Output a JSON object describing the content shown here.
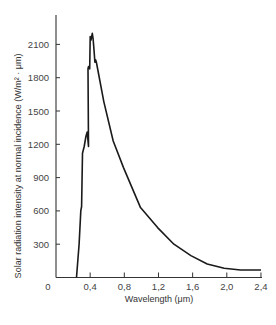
{
  "chart_data": {
    "type": "line",
    "title": "",
    "xlabel": "Wavelength (μm)",
    "ylabel": "Solar radiation intensity at normal incidence (W/m² · μm)",
    "xlim": [
      0,
      2.4
    ],
    "ylim": [
      0,
      2300
    ],
    "x_ticks": [
      0,
      0.4,
      0.8,
      1.2,
      1.6,
      2.0,
      2.4
    ],
    "x_tick_labels": [
      "0",
      "0,4",
      "0,8",
      "1,2",
      "1,6",
      "2,0",
      "2,4"
    ],
    "y_ticks": [
      300,
      600,
      900,
      1200,
      1500,
      1800,
      2100
    ],
    "y_tick_labels": [
      "300",
      "600",
      "900",
      "1200",
      "1500",
      "1800",
      "2100"
    ],
    "grid": false,
    "legend": null,
    "series": [
      {
        "name": "Solar spectral irradiance",
        "color": "#1a1a1a",
        "x": [
          0.24,
          0.27,
          0.29,
          0.3,
          0.31,
          0.33,
          0.35,
          0.365,
          0.38,
          0.375,
          0.38,
          0.395,
          0.4,
          0.41,
          0.425,
          0.435,
          0.445,
          0.455,
          0.465,
          0.475,
          0.48,
          0.56,
          0.67,
          0.79,
          0.99,
          1.19,
          1.38,
          1.58,
          1.77,
          1.97,
          2.16,
          2.4
        ],
        "y": [
          0,
          300,
          600,
          640,
          1120,
          1180,
          1270,
          1310,
          1180,
          1880,
          1900,
          1880,
          2170,
          2140,
          2200,
          2150,
          2050,
          1940,
          1960,
          1930,
          1910,
          1585,
          1230,
          990,
          630,
          450,
          300,
          197,
          122,
          83,
          68,
          68
        ]
      }
    ]
  },
  "layout": {
    "plot_left_px": 56,
    "plot_bottom_px": 277.5,
    "px_per_x_unit": 85.4,
    "px_per_y_unit": 0.111,
    "axis_top_px": 15,
    "axis_right_px": 262
  }
}
